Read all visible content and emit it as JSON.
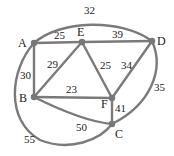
{
  "graph": {
    "nodes": [
      {
        "id": "A",
        "x": 34,
        "y": 43,
        "lx": 18,
        "ly": 47
      },
      {
        "id": "E",
        "x": 82,
        "y": 42,
        "lx": 77,
        "ly": 36
      },
      {
        "id": "D",
        "x": 152,
        "y": 41,
        "lx": 157,
        "ly": 45
      },
      {
        "id": "B",
        "x": 34,
        "y": 97,
        "lx": 19,
        "ly": 102
      },
      {
        "id": "F",
        "x": 112,
        "y": 98,
        "lx": 100,
        "ly": 108
      },
      {
        "id": "C",
        "x": 112,
        "y": 124,
        "lx": 114,
        "ly": 138
      }
    ],
    "edges": [
      {
        "from": "A",
        "to": "E",
        "weight": "25",
        "lx": 54,
        "ly": 38
      },
      {
        "from": "E",
        "to": "D",
        "weight": "39",
        "lx": 112,
        "ly": 37
      },
      {
        "from": "A",
        "to": "B",
        "weight": "30",
        "lx": 20,
        "ly": 77
      },
      {
        "from": "B",
        "to": "E",
        "weight": "29",
        "lx": 46,
        "ly": 68
      },
      {
        "from": "E",
        "to": "F",
        "weight": "25",
        "lx": 86,
        "ly": 70
      },
      {
        "from": "D",
        "to": "F",
        "weight": "34",
        "lx": 119,
        "ly": 69
      },
      {
        "from": "B",
        "to": "F",
        "weight": "23",
        "lx": 66,
        "ly": 92
      },
      {
        "from": "F",
        "to": "C",
        "weight": "41",
        "lx": 115,
        "ly": 109
      },
      {
        "from": "B",
        "to": "C",
        "weight": "50",
        "lx": 77,
        "ly": 131
      },
      {
        "from": "A",
        "to": "D",
        "weight": "32",
        "lx": 85,
        "ly": 14
      },
      {
        "from": "D",
        "to": "C",
        "weight": "35",
        "lx": 155,
        "ly": 90
      },
      {
        "from": "A",
        "to": "C",
        "weight": "55",
        "lx": 23,
        "ly": 141
      }
    ]
  },
  "labels": {
    "A": "A",
    "B": "B",
    "C": "C",
    "D": "D",
    "E": "E",
    "F": "F",
    "w_AE": "25",
    "w_ED": "39",
    "w_AB": "30",
    "w_BE": "29",
    "w_EF": "25",
    "w_DF": "34",
    "w_BF": "23",
    "w_FC": "41",
    "w_BC": "50",
    "w_AD": "32",
    "w_DC": "35",
    "w_AC": "55"
  }
}
